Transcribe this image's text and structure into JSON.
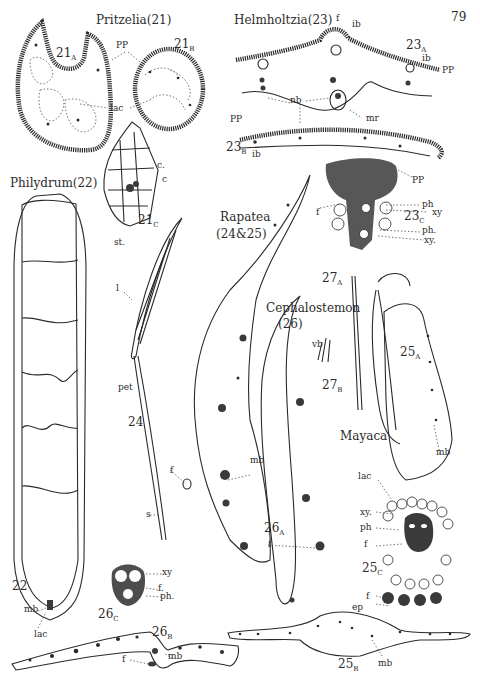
{
  "page": {
    "number": "79"
  },
  "figures": {
    "pritzelia": {
      "title": "Pritzelia(21)",
      "fig_a": "21",
      "fig_a_sub": "A",
      "fig_b": "21",
      "fig_b_sub": "B",
      "fig_c": "21",
      "fig_c_sub": "C",
      "labels": {
        "pp": "PP",
        "lac": "lac",
        "c1": "c.",
        "c2": "c",
        "st": "st."
      }
    },
    "helmholtzia": {
      "title": "Helmholtzia(23)",
      "fig_a": "23",
      "fig_a_sub": "A",
      "fig_b": "23",
      "fig_b_sub": "B",
      "fig_c": "23",
      "fig_c_sub": "C",
      "labels": {
        "f": "f",
        "ib_top": "ib",
        "ib_right": "ib",
        "pp_right": "PP",
        "nb": "nb",
        "mr": "mr",
        "pp_left": "PP",
        "ib_bottom": "ib",
        "pp_c": "PP",
        "ph1": "ph",
        "xy1": "xy",
        "ph2": "ph.",
        "xy2": "xy.",
        "f_c": "f"
      }
    },
    "philydrum": {
      "title": "Philydrum(22)",
      "fig": "22",
      "labels": {
        "mb": "mb",
        "lac": "lac"
      }
    },
    "rapatea": {
      "title": "Rapatea",
      "subtitle": "(24&25)",
      "fig_24": "24",
      "labels": {
        "l": "l",
        "pet": "pet",
        "s": "s"
      }
    },
    "cephalostemon": {
      "title": "Cephalostemon",
      "subtitle": "(26)",
      "fig_a": "26",
      "fig_a_sub": "A",
      "fig_b": "26",
      "fig_b_sub": "B",
      "fig_c": "26",
      "fig_c_sub": "C",
      "labels": {
        "mb": "mb",
        "f_left": "f",
        "f_a": "f",
        "xy": "xy",
        "f_c": "f.",
        "ph": "ph.",
        "f_b": "f",
        "mb_b": "mb"
      }
    },
    "fig27": {
      "fig_a": "27",
      "fig_a_sub": "A",
      "fig_b": "27",
      "fig_b_sub": "B",
      "labels": {
        "vb": "vb"
      }
    },
    "mayaca": {
      "title": "Mayaca",
      "fig_25a": "25",
      "fig_25a_sub": "A",
      "fig_25b": "25",
      "fig_25b_sub": "B",
      "fig_25c": "25",
      "fig_25c_sub": "C",
      "labels": {
        "mb": "mb",
        "lac": "lac",
        "xy": "xy.",
        "ph": "ph",
        "f": "f",
        "f2": "f",
        "ep": "ep",
        "mb_b": "mb"
      }
    }
  }
}
